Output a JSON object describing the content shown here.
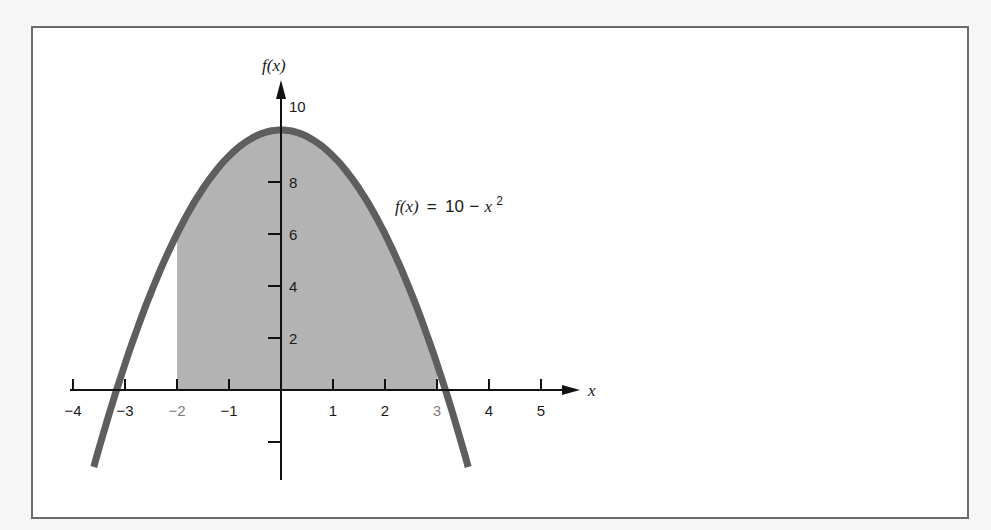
{
  "figure": {
    "y_axis_label": "f(x)",
    "x_axis_label": "x",
    "function_label": {
      "lhs": "f(x)",
      "eq": "=",
      "rhs_const": "10",
      "rhs_minus": "−",
      "rhs_var": "x",
      "rhs_exp": "2"
    },
    "x_ticks": [
      {
        "value": -4,
        "label": "−4"
      },
      {
        "value": -3,
        "label": "−3"
      },
      {
        "value": -2,
        "label": "−2",
        "highlight": true
      },
      {
        "value": -1,
        "label": "−1"
      },
      {
        "value": 1,
        "label": "1"
      },
      {
        "value": 2,
        "label": "2"
      },
      {
        "value": 3,
        "label": "3",
        "highlight": true
      },
      {
        "value": 4,
        "label": "4"
      },
      {
        "value": 5,
        "label": "5"
      }
    ],
    "y_ticks": [
      {
        "value": 2,
        "label": "2"
      },
      {
        "value": 4,
        "label": "4"
      },
      {
        "value": 6,
        "label": "6"
      },
      {
        "value": 8,
        "label": "8"
      },
      {
        "value": 10,
        "label": "10"
      }
    ],
    "colors": {
      "curve": "#5e5e5e",
      "shade": "#b3b3b3",
      "axis": "#111111",
      "frame": "#6b6b6b",
      "highlight_label": "#7d7d7d"
    }
  },
  "chart_data": {
    "type": "area",
    "title": "",
    "function": "f(x) = 10 - x^2",
    "xlabel": "x",
    "ylabel": "f(x)",
    "xlim": [
      -4,
      5
    ],
    "ylim": [
      -3,
      11
    ],
    "x_tick_labels": [
      "-4",
      "-3",
      "-2",
      "-1",
      "1",
      "2",
      "3",
      "4",
      "5"
    ],
    "y_tick_labels": [
      "2",
      "4",
      "6",
      "8",
      "10"
    ],
    "shaded_interval": [
      -2,
      3
    ],
    "curve_plot_range": [
      -3.6,
      3.6
    ],
    "x": [
      -3.6,
      -3,
      -2,
      -1,
      0,
      1,
      2,
      3,
      3.6
    ],
    "values": [
      -2.96,
      1,
      6,
      9,
      10,
      9,
      6,
      1,
      -2.96
    ],
    "annotations": [
      "f(x) = 10 − x²"
    ],
    "grid": false,
    "legend": "none"
  }
}
